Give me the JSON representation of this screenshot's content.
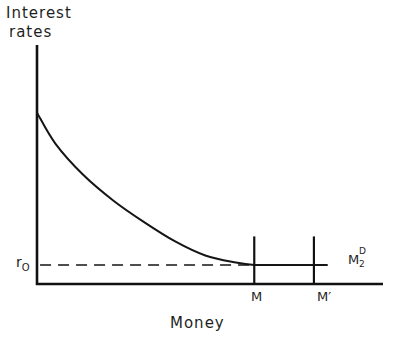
{
  "chart_data": {
    "type": "line",
    "title": "",
    "caption_fragment": "CHART 1-3",
    "ylabel_lines": [
      "Interest",
      "rates"
    ],
    "xlabel": "Money",
    "grid": false,
    "legend": "none",
    "axes": {
      "x_range": [
        0,
        10
      ],
      "y_range": [
        0,
        10
      ]
    },
    "series": [
      {
        "name": "M2D",
        "label_main": "M",
        "label_sup": "D",
        "label_sub": "2",
        "style": "solid",
        "description": "Money demand curve, decaying toward liquidity-trap floor r0, then horizontal",
        "points": [
          [
            0,
            7.2
          ],
          [
            0.6,
            5.9
          ],
          [
            1.5,
            4.6
          ],
          [
            2.5,
            3.5
          ],
          [
            3.5,
            2.6
          ],
          [
            4.5,
            1.8
          ],
          [
            5.5,
            1.2
          ],
          [
            6.5,
            0.9
          ],
          [
            7.1,
            0.8
          ],
          [
            8.0,
            0.8
          ],
          [
            9.5,
            0.8
          ]
        ]
      },
      {
        "name": "r0-reference",
        "style": "dashed",
        "points": [
          [
            0.1,
            0.8
          ],
          [
            7.1,
            0.8
          ]
        ]
      }
    ],
    "vertical_lines": [
      {
        "name": "M",
        "label": "M",
        "x": 7.1,
        "y_top": 2.0
      },
      {
        "name": "M-prime",
        "label": "M′",
        "x": 9.05,
        "y_top": 2.0
      }
    ],
    "y_markers": [
      {
        "name": "r0",
        "label_main": "r",
        "label_sub": "O",
        "y": 0.8
      }
    ]
  }
}
